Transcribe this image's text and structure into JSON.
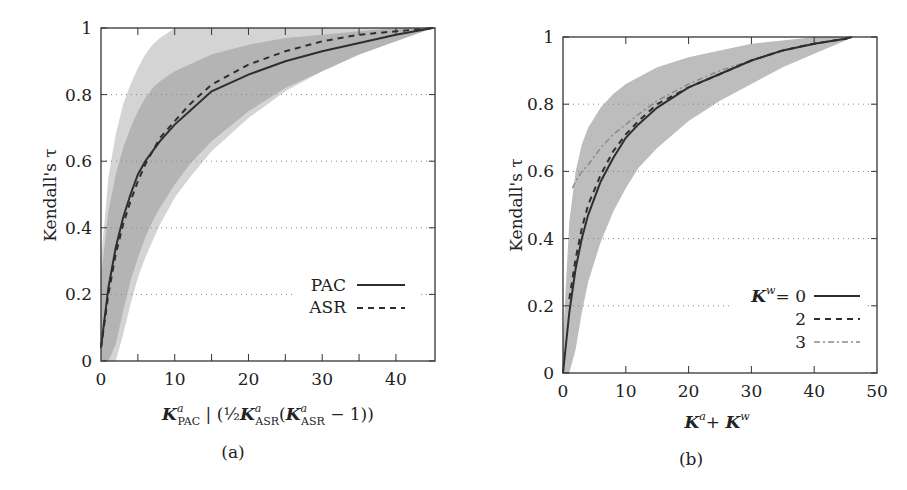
{
  "figure": {
    "captions": [
      "(a)",
      "(b)"
    ]
  },
  "colors": {
    "band_outer": "#d4d4d4",
    "band_inner": "#b4b4b4",
    "band_b": "#bdbdbd",
    "line_dark": "#2e2e2e",
    "line_gray": "#8a8a8a",
    "grid": "#888888",
    "axis": "#333333"
  },
  "chart_data": [
    {
      "id": "a",
      "type": "line",
      "title": "",
      "caption": "(a)",
      "xlabel": "K^a_PAC | (½ K^a_ASR (K^a_ASR − 1))",
      "xlabel_parts": {
        "k1": "K",
        "k1_sup": "a",
        "k1_sub": "PAC",
        "sep": " | (",
        "half": "½",
        "k2": "K",
        "k2_sup": "a",
        "k2_sub": "ASR",
        "paren": "(",
        "k3": "K",
        "k3_sup": "a",
        "k3_sub": "ASR",
        "tail": " − 1))"
      },
      "ylabel": "Kendall's τ",
      "xlim": [
        0,
        45.3
      ],
      "ylim": [
        0,
        1
      ],
      "xticks": [
        0,
        10,
        20,
        30,
        40
      ],
      "xminor_ticks": [
        5,
        15,
        25,
        35
      ],
      "yticks": [
        0,
        0.2,
        0.4,
        0.6,
        0.8,
        1
      ],
      "ytick_labels": [
        "0",
        "0.2",
        "0.4",
        "0.6",
        "0.8",
        "1"
      ],
      "grid": "horizontal dotted",
      "legend": {
        "position": "lower right",
        "entries": [
          {
            "label": "PAC",
            "style": "solid"
          },
          {
            "label": "ASR",
            "style": "dashed"
          }
        ]
      },
      "series": [
        {
          "name": "PAC",
          "style": "solid",
          "x": [
            0,
            1,
            2,
            3,
            4,
            5,
            6,
            7,
            8,
            10,
            12,
            15,
            20,
            25,
            30,
            35,
            40,
            45
          ],
          "y": [
            0.04,
            0.22,
            0.34,
            0.43,
            0.5,
            0.56,
            0.6,
            0.63,
            0.66,
            0.71,
            0.75,
            0.81,
            0.86,
            0.9,
            0.93,
            0.955,
            0.98,
            1.0
          ],
          "band_inner_low": [
            0.0,
            0.0,
            0.05,
            0.15,
            0.24,
            0.31,
            0.37,
            0.42,
            0.46,
            0.53,
            0.59,
            0.66,
            0.75,
            0.82,
            0.87,
            0.92,
            0.96,
            1.0
          ],
          "band_inner_high": [
            0.25,
            0.45,
            0.56,
            0.64,
            0.7,
            0.75,
            0.79,
            0.82,
            0.84,
            0.87,
            0.89,
            0.92,
            0.95,
            0.97,
            0.98,
            0.99,
            1.0,
            1.0
          ]
        },
        {
          "name": "ASR",
          "style": "dashed",
          "x": [
            0,
            1,
            2,
            3,
            4,
            5,
            6,
            7,
            8,
            10,
            12,
            15,
            20,
            25,
            30,
            35,
            40,
            45
          ],
          "y": [
            0.04,
            0.2,
            0.32,
            0.41,
            0.48,
            0.54,
            0.59,
            0.63,
            0.67,
            0.72,
            0.77,
            0.83,
            0.89,
            0.93,
            0.96,
            0.98,
            0.99,
            1.0
          ],
          "band_outer_low": [
            0.0,
            0.0,
            0.0,
            0.08,
            0.17,
            0.25,
            0.31,
            0.36,
            0.41,
            0.49,
            0.55,
            0.63,
            0.73,
            0.81,
            0.87,
            0.92,
            0.96,
            1.0
          ],
          "band_outer_high": [
            0.3,
            0.55,
            0.68,
            0.77,
            0.83,
            0.88,
            0.92,
            0.95,
            0.97,
            1.0,
            1.0,
            1.0,
            1.0,
            1.0,
            1.0,
            1.0,
            1.0,
            1.0
          ]
        }
      ]
    },
    {
      "id": "b",
      "type": "line",
      "title": "",
      "caption": "(b)",
      "xlabel": "K^a + K^w",
      "xlabel_parts": {
        "k1": "K",
        "k1_sup": "a",
        "plus": "+ ",
        "k2": "K",
        "k2_sup": "w"
      },
      "ylabel": "Kendall's τ",
      "xlim": [
        0,
        50
      ],
      "ylim": [
        0,
        1
      ],
      "xticks": [
        0,
        10,
        20,
        30,
        40,
        50
      ],
      "yticks": [
        0,
        0.2,
        0.4,
        0.6,
        0.8,
        1
      ],
      "ytick_labels": [
        "0",
        "0.2",
        "0.4",
        "0.6",
        "0.8",
        "1"
      ],
      "grid": "horizontal dotted",
      "legend": {
        "position": "lower right",
        "title_k": "K",
        "title_sup": "w",
        "title_eq": "= ",
        "entries": [
          {
            "label": "0",
            "style": "solid"
          },
          {
            "label": "2",
            "style": "dashed"
          },
          {
            "label": "3",
            "style": "dash-dot gray"
          }
        ]
      },
      "series": [
        {
          "name": "K^w = 0",
          "style": "solid",
          "x": [
            0,
            1,
            2,
            3,
            4,
            6,
            8,
            10,
            12,
            15,
            20,
            25,
            30,
            35,
            40,
            45,
            46
          ],
          "y": [
            0.0,
            0.18,
            0.31,
            0.4,
            0.47,
            0.57,
            0.64,
            0.7,
            0.74,
            0.79,
            0.85,
            0.89,
            0.93,
            0.96,
            0.98,
            0.995,
            1.0
          ]
        },
        {
          "name": "K^w = 2",
          "style": "dashed",
          "x": [
            1,
            2,
            3,
            4,
            6,
            8,
            10,
            12,
            15,
            20,
            25,
            30,
            35,
            40,
            45,
            46
          ],
          "y": [
            0.22,
            0.34,
            0.43,
            0.5,
            0.59,
            0.66,
            0.71,
            0.75,
            0.8,
            0.85,
            0.89,
            0.93,
            0.96,
            0.98,
            0.995,
            1.0
          ]
        },
        {
          "name": "K^w = 3",
          "style": "dash-dot gray",
          "x": [
            1.5,
            2,
            3,
            4,
            6,
            8,
            10,
            12,
            15,
            20,
            25,
            30,
            35,
            40,
            45,
            46
          ],
          "y": [
            0.55,
            0.57,
            0.6,
            0.62,
            0.67,
            0.71,
            0.74,
            0.77,
            0.81,
            0.86,
            0.9,
            0.93,
            0.96,
            0.98,
            0.995,
            1.0
          ]
        }
      ],
      "band": {
        "x": [
          0,
          1,
          2,
          3,
          4,
          6,
          8,
          10,
          12,
          15,
          20,
          25,
          30,
          35,
          40,
          45,
          46
        ],
        "low": [
          0.0,
          0.0,
          0.07,
          0.18,
          0.27,
          0.39,
          0.48,
          0.55,
          0.61,
          0.67,
          0.75,
          0.81,
          0.86,
          0.91,
          0.95,
          0.99,
          1.0
        ],
        "high": [
          0.1,
          0.45,
          0.6,
          0.68,
          0.73,
          0.79,
          0.83,
          0.86,
          0.88,
          0.91,
          0.94,
          0.96,
          0.98,
          0.99,
          1.0,
          1.0,
          1.0
        ]
      }
    }
  ]
}
